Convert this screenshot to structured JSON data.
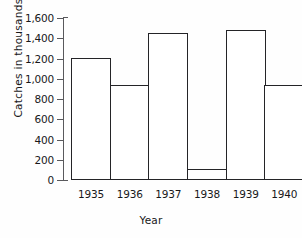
{
  "chart_data": {
    "type": "bar",
    "title": "",
    "xlabel": "Year",
    "ylabel": "Catches in thousands",
    "categories": [
      "1935",
      "1936",
      "1937",
      "1938",
      "1939",
      "1940"
    ],
    "values": [
      1205,
      935,
      1455,
      110,
      1485,
      935
    ],
    "ylim": [
      0,
      1600
    ],
    "ytick_values": [
      0,
      200,
      400,
      600,
      800,
      1000,
      1200,
      1400,
      1600
    ],
    "ytick_labels": [
      "0",
      "200",
      "400",
      "600",
      "800",
      "1,000",
      "1,200",
      "1,400",
      "1,600"
    ],
    "grid": false,
    "legend": false,
    "bar_fill": "#ffffff",
    "bar_edge": "#242427",
    "axis_color": "#59595c",
    "background": "#fefefe"
  }
}
